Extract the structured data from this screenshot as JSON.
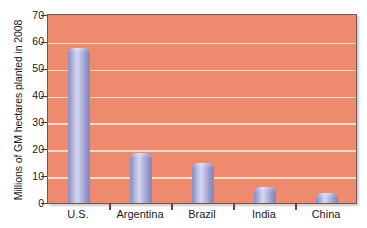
{
  "chart_data": {
    "type": "bar",
    "title": "",
    "xlabel": "",
    "ylabel": "Millions of GM hectares planted in 2008",
    "categories": [
      "U.S.",
      "Argentina",
      "Brazil",
      "India",
      "China"
    ],
    "values": [
      57.7,
      18.8,
      15.0,
      6.0,
      3.7
    ],
    "ylim": [
      0,
      70
    ],
    "yticks": [
      0,
      10,
      20,
      30,
      40,
      50,
      60,
      70
    ],
    "ytick_labels": [
      "0",
      "10",
      "20",
      "30",
      "40",
      "50",
      "60",
      "70"
    ],
    "grid": true,
    "grid_axis": "y",
    "legend": false,
    "series": [
      {
        "name": "GM hectares planted",
        "values": [
          57.7,
          18.8,
          15.0,
          6.0,
          3.7
        ]
      }
    ]
  },
  "colors": {
    "plot_background": "#ee8a6e",
    "gridline": "#fbd9c4",
    "bar_fill": "#b4b6dd",
    "bar_edge": "#8385bb",
    "axis_border": "#6b5a57",
    "tick_mark": "#3c3c3c",
    "x_separator_tick": "#8a3a28",
    "text": "#1a1a1a",
    "page_background": "#ffffff"
  }
}
